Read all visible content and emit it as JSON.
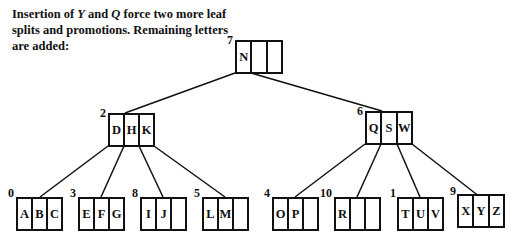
{
  "caption": {
    "part1": "Insertion of ",
    "key1": "Y",
    "part2": " and ",
    "key2": "Q",
    "part3": " force two more leaf splits and promotions. Remaining letters are added:"
  },
  "tree": {
    "root": {
      "id": "7",
      "keys": [
        "N",
        "",
        ""
      ]
    },
    "internal": [
      {
        "id": "2",
        "keys": [
          "D",
          "H",
          "K"
        ]
      },
      {
        "id": "6",
        "keys": [
          "Q",
          "S",
          "W"
        ]
      }
    ],
    "leaves": [
      {
        "id": "0",
        "keys": [
          "A",
          "B",
          "C"
        ]
      },
      {
        "id": "3",
        "keys": [
          "E",
          "F",
          "G"
        ]
      },
      {
        "id": "8",
        "keys": [
          "I",
          "J",
          ""
        ]
      },
      {
        "id": "5",
        "keys": [
          "L",
          "M",
          ""
        ]
      },
      {
        "id": "4",
        "keys": [
          "O",
          "P",
          ""
        ]
      },
      {
        "id": "10",
        "keys": [
          "R",
          "",
          ""
        ]
      },
      {
        "id": "1",
        "keys": [
          "T",
          "U",
          "V"
        ]
      },
      {
        "id": "9",
        "keys": [
          "X",
          "Y",
          "Z"
        ]
      }
    ]
  }
}
